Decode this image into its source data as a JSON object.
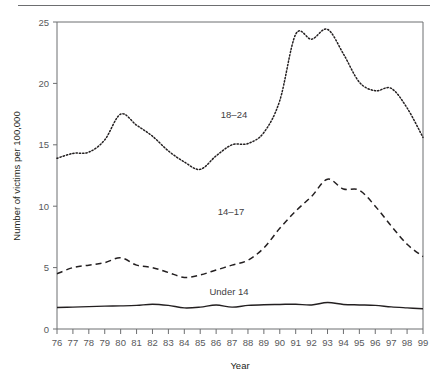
{
  "figure": {
    "name": "victims-by-age-line-chart"
  },
  "chart_data": {
    "type": "line",
    "title": "",
    "xlabel": "Year",
    "ylabel": "Number of victims per 100,000",
    "x": [
      "76",
      "77",
      "78",
      "79",
      "80",
      "81",
      "82",
      "83",
      "84",
      "85",
      "86",
      "87",
      "88",
      "89",
      "90",
      "91",
      "92",
      "93",
      "94",
      "95",
      "96",
      "97",
      "98",
      "99"
    ],
    "xticklabels": [
      "76",
      "77",
      "78",
      "79",
      "80",
      "81",
      "82",
      "83",
      "84",
      "85",
      "86",
      "87",
      "88",
      "89",
      "90",
      "91",
      "92",
      "93",
      "94",
      "95",
      "96",
      "97",
      "98",
      "99"
    ],
    "yticklabels": [
      "0",
      "5",
      "10",
      "15",
      "20",
      "25"
    ],
    "yticks": [
      0,
      5,
      10,
      15,
      20,
      25
    ],
    "ylim": [
      0,
      25
    ],
    "grid": false,
    "legend_position": "inline-annotations",
    "series": [
      {
        "name": "18-24",
        "label": "18–24",
        "linestyle": "dotted",
        "color": "#231f20",
        "values": [
          13.9,
          14.3,
          14.4,
          15.4,
          17.5,
          16.6,
          15.7,
          14.5,
          13.6,
          13.0,
          14.1,
          15.0,
          15.1,
          16.0,
          18.6,
          24.0,
          23.6,
          24.4,
          22.4,
          20.1,
          19.4,
          19.6,
          18.0,
          15.6
        ]
      },
      {
        "name": "14-17",
        "label": "14–17",
        "linestyle": "dashed",
        "color": "#231f20",
        "values": [
          4.5,
          5.0,
          5.2,
          5.4,
          5.8,
          5.2,
          5.0,
          4.6,
          4.2,
          4.4,
          4.8,
          5.2,
          5.6,
          6.6,
          8.2,
          9.6,
          10.8,
          12.2,
          11.4,
          11.3,
          10.0,
          8.4,
          6.9,
          5.9
        ]
      },
      {
        "name": "Under 14",
        "label": "Under 14",
        "linestyle": "solid",
        "color": "#231f20",
        "values": [
          1.75,
          1.78,
          1.82,
          1.86,
          1.88,
          1.92,
          2.02,
          1.92,
          1.72,
          1.78,
          1.95,
          1.78,
          1.92,
          1.98,
          2.0,
          2.02,
          1.96,
          2.16,
          2.0,
          1.96,
          1.92,
          1.8,
          1.72,
          1.65
        ]
      }
    ],
    "annotations": [
      {
        "text": "18–24",
        "series": "18-24",
        "x_px": 234,
        "y_px": 118
      },
      {
        "text": "14–17",
        "series": "14-17",
        "x_px": 231,
        "y_px": 215
      },
      {
        "text": "Under 14",
        "series": "Under 14",
        "x_px": 229,
        "y_px": 295
      }
    ]
  }
}
